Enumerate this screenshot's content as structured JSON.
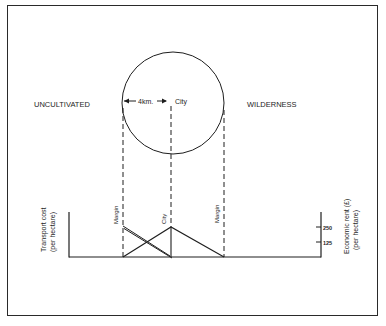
{
  "diagram": {
    "type": "von-thunen-rent-gradient",
    "region_labels": {
      "left": "UNCULTIVATED",
      "right": "WILDERNESS"
    },
    "circle": {
      "radius_label": "4km.",
      "center_label": "City"
    },
    "profile": {
      "left_axis_label_line1": "Transport cost",
      "left_axis_label_line2": "(per hectare)",
      "right_axis_label_line1": "Economic rent (£)",
      "right_axis_label_line2": "(per hectare)",
      "right_axis_ticks": [
        "250",
        "125"
      ],
      "vertical_markers": [
        "Margin",
        "City",
        "Margin"
      ]
    }
  },
  "colors": {
    "ink": "#1e1e1e",
    "background": "#ffffff"
  }
}
